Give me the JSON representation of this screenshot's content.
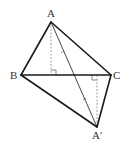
{
  "diagram": {
    "colors": {
      "edge": "#1a1a1a",
      "dashed": "#888888",
      "label": "#333333"
    },
    "points": {
      "A": {
        "label": "A",
        "x": 51,
        "y": 22
      },
      "B": {
        "label": "B",
        "x": 21,
        "y": 75
      },
      "C": {
        "label": "C",
        "x": 111,
        "y": 75
      },
      "A_prime": {
        "label": "A′",
        "x": 98,
        "y": 127
      }
    },
    "labels": {
      "A": "A",
      "B": "B",
      "C": "C",
      "A_prime": "A′"
    },
    "features": {
      "altitude_from_A": "dashed, perpendicular to BC with right-angle mark",
      "altitude_from_A_prime": "dashed, perpendicular to BC with right-angle mark",
      "segment_AA_prime": "thin line with two equal tick marks"
    }
  }
}
